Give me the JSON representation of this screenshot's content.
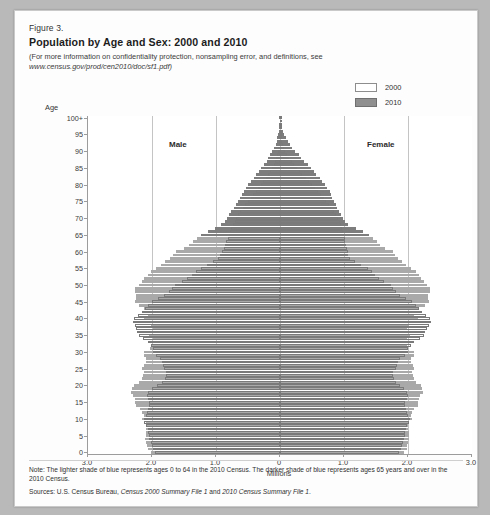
{
  "figure": {
    "label": "Figure 3.",
    "title": "Population by Age and Sex: 2000 and 2010",
    "subnote_pre": "(For more information on confidentiality protection, nonsampling error, and definitions, see",
    "subnote_url": "www.census.gov/prod/cen2010/doc/sf1.pdf)"
  },
  "legend": {
    "items": [
      {
        "label": "2000",
        "color": "#ffffff"
      },
      {
        "label": "2010",
        "color": "#8f8f8f"
      }
    ]
  },
  "labels": {
    "age_axis": "Age",
    "male": "Male",
    "female": "Female",
    "x_title": "Millions"
  },
  "footer": {
    "note": "Note: The lighter shade of blue represents ages 0 to 64 in the 2010 Census. The darker shade of blue represents ages 65 years and over in the 2010 Census.",
    "sources_pre": "Sources: U.S. Census Bureau, ",
    "sources_it1": "Census 2000 Summary File 1",
    "sources_mid": " and ",
    "sources_it2": "2010 Census Summary File 1",
    "sources_end": "."
  },
  "chart_data": {
    "type": "bar",
    "subtype": "population-pyramid",
    "title": "Population by Age and Sex: 2000 and 2010",
    "xlabel": "Millions",
    "ylabel": "Age",
    "xlim": [
      -3.0,
      3.0
    ],
    "x_ticks": [
      3.0,
      2.0,
      1.0,
      0,
      1.0,
      2.0,
      3.0
    ],
    "x_tick_labels": [
      "3.0",
      "2.0",
      "1.0",
      "0",
      "1.0",
      "2.0",
      "3.0"
    ],
    "y_ticks": [
      0,
      5,
      10,
      15,
      20,
      25,
      30,
      35,
      40,
      45,
      50,
      55,
      60,
      65,
      70,
      75,
      80,
      85,
      90,
      95,
      100
    ],
    "y_tick_labels": [
      "0",
      "5",
      "10",
      "15",
      "20",
      "25",
      "30",
      "35",
      "40",
      "45",
      "50",
      "55",
      "60",
      "65",
      "70",
      "75",
      "80",
      "85",
      "90",
      "95",
      "100+"
    ],
    "grid": "vertical",
    "legend_position": "top-right",
    "age_split_old": 65,
    "units": "millions",
    "series": [
      {
        "name": "2010",
        "style": "filled",
        "colors": {
          "0_64": "#a9a9a9",
          "65_plus": "#7d7d7d"
        },
        "male": [
          2.02,
          2.07,
          2.08,
          2.09,
          2.11,
          2.1,
          2.1,
          2.09,
          2.09,
          2.1,
          2.16,
          2.13,
          2.15,
          2.19,
          2.25,
          2.26,
          2.27,
          2.29,
          2.33,
          2.31,
          2.28,
          2.2,
          2.16,
          2.14,
          2.13,
          2.15,
          2.13,
          2.1,
          2.09,
          2.13,
          2.12,
          2.03,
          2.0,
          1.98,
          1.99,
          2.04,
          2.0,
          1.98,
          2.01,
          2.06,
          2.13,
          2.07,
          2.08,
          2.13,
          2.21,
          2.27,
          2.25,
          2.25,
          2.27,
          2.26,
          2.21,
          2.16,
          2.12,
          2.07,
          2.02,
          1.94,
          1.86,
          1.79,
          1.72,
          1.67,
          1.62,
          1.5,
          1.42,
          1.36,
          1.3,
          1.23,
          1.13,
          1.02,
          0.92,
          0.86,
          0.83,
          0.79,
          0.76,
          0.72,
          0.69,
          0.66,
          0.63,
          0.6,
          0.57,
          0.53,
          0.5,
          0.45,
          0.41,
          0.37,
          0.33,
          0.29,
          0.25,
          0.21,
          0.18,
          0.15,
          0.12,
          0.09,
          0.07,
          0.05,
          0.04,
          0.03,
          0.02,
          0.015,
          0.01,
          0.007,
          0.011
        ],
        "female": [
          1.93,
          1.98,
          1.99,
          2.0,
          2.02,
          2.01,
          2.01,
          2.0,
          2.0,
          2.01,
          2.07,
          2.04,
          2.06,
          2.09,
          2.15,
          2.16,
          2.17,
          2.19,
          2.23,
          2.22,
          2.2,
          2.13,
          2.09,
          2.08,
          2.07,
          2.09,
          2.08,
          2.05,
          2.05,
          2.09,
          2.09,
          2.0,
          1.98,
          1.96,
          1.98,
          2.03,
          2.0,
          1.99,
          2.02,
          2.08,
          2.16,
          2.1,
          2.12,
          2.17,
          2.26,
          2.33,
          2.31,
          2.32,
          2.34,
          2.34,
          2.29,
          2.25,
          2.21,
          2.17,
          2.12,
          2.05,
          1.97,
          1.9,
          1.84,
          1.8,
          1.76,
          1.64,
          1.56,
          1.51,
          1.45,
          1.39,
          1.29,
          1.18,
          1.07,
          1.01,
          0.99,
          0.95,
          0.92,
          0.89,
          0.87,
          0.84,
          0.82,
          0.8,
          0.78,
          0.74,
          0.71,
          0.66,
          0.62,
          0.57,
          0.53,
          0.48,
          0.43,
          0.38,
          0.33,
          0.29,
          0.24,
          0.19,
          0.15,
          0.12,
          0.09,
          0.07,
          0.05,
          0.038,
          0.027,
          0.019,
          0.038
        ]
      },
      {
        "name": "2000",
        "style": "outline",
        "colors": {
          "line": "#7a7a7a",
          "fill": "#ffffff"
        },
        "male": [
          1.95,
          1.98,
          2.0,
          2.01,
          2.04,
          2.05,
          2.06,
          2.07,
          2.09,
          2.12,
          2.13,
          2.1,
          2.08,
          2.06,
          2.04,
          2.04,
          2.06,
          2.08,
          2.06,
          2.0,
          1.92,
          1.85,
          1.8,
          1.78,
          1.78,
          1.81,
          1.83,
          1.84,
          1.87,
          1.93,
          1.98,
          1.98,
          2.01,
          2.06,
          2.14,
          2.21,
          2.23,
          2.25,
          2.27,
          2.3,
          2.28,
          2.22,
          2.16,
          2.11,
          2.06,
          2.0,
          1.9,
          1.81,
          1.73,
          1.68,
          1.64,
          1.53,
          1.45,
          1.38,
          1.31,
          1.24,
          1.14,
          1.04,
          0.97,
          0.93,
          0.91,
          0.88,
          0.86,
          0.84,
          0.82,
          0.8,
          0.78,
          0.76,
          0.74,
          0.71,
          0.68,
          0.65,
          0.62,
          0.58,
          0.54,
          0.5,
          0.46,
          0.42,
          0.38,
          0.34,
          0.3,
          0.26,
          0.22,
          0.19,
          0.16,
          0.13,
          0.1,
          0.08,
          0.06,
          0.045,
          0.033,
          0.024,
          0.017,
          0.012,
          0.008,
          0.006,
          0.004,
          0.003,
          0.002,
          0.0013,
          0.0024
        ],
        "female": [
          1.86,
          1.89,
          1.91,
          1.92,
          1.94,
          1.95,
          1.96,
          1.97,
          1.99,
          2.02,
          2.03,
          2.0,
          1.99,
          1.97,
          1.96,
          1.96,
          1.98,
          2.0,
          1.99,
          1.94,
          1.88,
          1.82,
          1.78,
          1.77,
          1.77,
          1.81,
          1.83,
          1.85,
          1.88,
          1.95,
          2.0,
          2.0,
          2.04,
          2.09,
          2.18,
          2.25,
          2.27,
          2.3,
          2.33,
          2.36,
          2.34,
          2.28,
          2.22,
          2.17,
          2.13,
          2.07,
          1.97,
          1.88,
          1.81,
          1.76,
          1.73,
          1.62,
          1.55,
          1.49,
          1.43,
          1.37,
          1.27,
          1.17,
          1.1,
          1.07,
          1.06,
          1.04,
          1.03,
          1.02,
          1.01,
          1.0,
          0.99,
          0.97,
          0.95,
          0.93,
          0.9,
          0.87,
          0.84,
          0.8,
          0.76,
          0.72,
          0.68,
          0.64,
          0.59,
          0.55,
          0.5,
          0.45,
          0.4,
          0.35,
          0.31,
          0.26,
          0.22,
          0.18,
          0.14,
          0.11,
          0.085,
          0.064,
          0.047,
          0.034,
          0.024,
          0.017,
          0.012,
          0.008,
          0.006,
          0.004,
          0.009
        ]
      }
    ]
  }
}
